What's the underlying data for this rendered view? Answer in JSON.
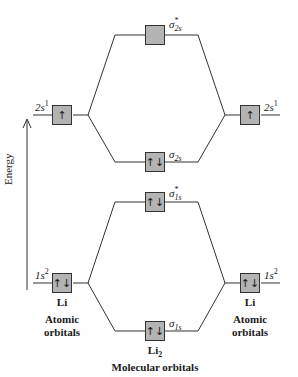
{
  "diagram": {
    "title": "Molecular orbitals",
    "energy_axis_label": "Energy",
    "left_atom": {
      "name": "Li",
      "caption_line1": "Atomic",
      "caption_line2": "orbitals",
      "orbitals": [
        {
          "id": "2s",
          "label": "2s",
          "occupancy": "1",
          "electrons": "↑"
        },
        {
          "id": "1s",
          "label": "1s",
          "occupancy": "2",
          "electrons": "↑↓"
        }
      ]
    },
    "right_atom": {
      "name": "Li",
      "caption_line1": "Atomic",
      "caption_line2": "orbitals",
      "orbitals": [
        {
          "id": "2s",
          "label": "2s",
          "occupancy": "1",
          "electrons": "↑"
        },
        {
          "id": "1s",
          "label": "1s",
          "occupancy": "2",
          "electrons": "↑↓"
        }
      ]
    },
    "molecule": {
      "name": "Li",
      "subscript": "2",
      "orbitals": [
        {
          "id": "sigma_star_2s",
          "symbol": "σ",
          "star": "*",
          "sub": "2s",
          "electrons": ""
        },
        {
          "id": "sigma_2s",
          "symbol": "σ",
          "star": "",
          "sub": "2s",
          "electrons": "↑↓"
        },
        {
          "id": "sigma_star_1s",
          "symbol": "σ",
          "star": "*",
          "sub": "1s",
          "electrons": "↑↓"
        },
        {
          "id": "sigma_1s",
          "symbol": "σ",
          "star": "",
          "sub": "1s",
          "electrons": "↑↓"
        }
      ]
    }
  }
}
